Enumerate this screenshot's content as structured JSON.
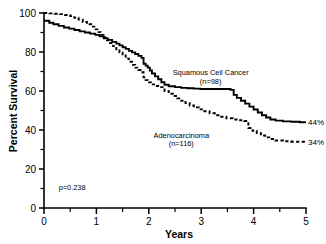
{
  "chart_data": {
    "type": "line",
    "title": "",
    "xlabel": "Years",
    "ylabel": "Percent Survival",
    "xlim": [
      0,
      5
    ],
    "ylim": [
      0,
      100
    ],
    "grid": false,
    "legend_position": "inline-annotation",
    "x_ticks": [
      "0",
      "1",
      "2",
      "3",
      "4",
      "5"
    ],
    "x_tick_values": [
      0,
      1,
      2,
      3,
      4,
      5
    ],
    "x_minor_tick_values": [
      0.5,
      1.5,
      2.5,
      3.5,
      4.5
    ],
    "y_ticks": [
      "0",
      "20",
      "40",
      "60",
      "80",
      "100"
    ],
    "y_tick_values": [
      0,
      20,
      40,
      60,
      80,
      100
    ],
    "y_minor_tick_values": [
      10,
      30,
      50,
      70,
      90
    ],
    "annotations": [
      {
        "name": "p-value",
        "text": "p=0.238",
        "x": 0.28,
        "y": 9
      },
      {
        "name": "squamous-endpoint",
        "text": "44%",
        "x": 5.02,
        "y": 44
      },
      {
        "name": "adeno-endpoint",
        "text": "34%",
        "x": 5.02,
        "y": 34
      }
    ],
    "series": [
      {
        "name": "Squamous Cell Cancer",
        "label": "Squamous Cell Cancer",
        "n_label": "(n=98)",
        "n": 98,
        "style": "solid",
        "color": "#000000",
        "final_value": 44,
        "label_x": 3.18,
        "label_y": 68,
        "points": [
          [
            0.0,
            96.0
          ],
          [
            0.1,
            95.0
          ],
          [
            0.18,
            94.2
          ],
          [
            0.28,
            93.4
          ],
          [
            0.38,
            92.6
          ],
          [
            0.48,
            92.0
          ],
          [
            0.58,
            91.3
          ],
          [
            0.68,
            90.6
          ],
          [
            0.78,
            90.0
          ],
          [
            0.88,
            89.4
          ],
          [
            0.98,
            88.8
          ],
          [
            1.06,
            88.0
          ],
          [
            1.14,
            87.0
          ],
          [
            1.22,
            86.2
          ],
          [
            1.3,
            85.2
          ],
          [
            1.38,
            84.3
          ],
          [
            1.44,
            83.4
          ],
          [
            1.5,
            82.4
          ],
          [
            1.56,
            81.6
          ],
          [
            1.62,
            80.6
          ],
          [
            1.68,
            79.8
          ],
          [
            1.74,
            79.0
          ],
          [
            1.8,
            78.0
          ],
          [
            1.86,
            77.0
          ],
          [
            1.9,
            74.0
          ],
          [
            1.94,
            73.0
          ],
          [
            1.98,
            72.0
          ],
          [
            2.02,
            70.5
          ],
          [
            2.06,
            69.0
          ],
          [
            2.12,
            67.5
          ],
          [
            2.18,
            66.0
          ],
          [
            2.24,
            64.5
          ],
          [
            2.3,
            63.2
          ],
          [
            2.38,
            62.4
          ],
          [
            2.5,
            62.0
          ],
          [
            2.62,
            61.6
          ],
          [
            2.74,
            61.4
          ],
          [
            2.86,
            61.2
          ],
          [
            2.98,
            61.0
          ],
          [
            3.1,
            61.0
          ],
          [
            3.22,
            61.0
          ],
          [
            3.34,
            61.0
          ],
          [
            3.46,
            61.0
          ],
          [
            3.56,
            60.6
          ],
          [
            3.62,
            58.0
          ],
          [
            3.68,
            56.5
          ],
          [
            3.76,
            55.0
          ],
          [
            3.84,
            53.5
          ],
          [
            3.92,
            52.0
          ],
          [
            4.0,
            50.5
          ],
          [
            4.08,
            49.0
          ],
          [
            4.16,
            47.6
          ],
          [
            4.24,
            46.4
          ],
          [
            4.32,
            45.4
          ],
          [
            4.42,
            44.8
          ],
          [
            4.56,
            44.4
          ],
          [
            4.72,
            44.2
          ],
          [
            4.88,
            44.0
          ],
          [
            5.0,
            44.0
          ]
        ]
      },
      {
        "name": "Adenocarcinoma",
        "label": "Adenocarcinoma",
        "n_label": "(n=116)",
        "n": 116,
        "style": "dashed",
        "color": "#000000",
        "final_value": 34,
        "label_x": 2.62,
        "label_y": 36,
        "points": [
          [
            0.0,
            100.0
          ],
          [
            0.1,
            99.8
          ],
          [
            0.2,
            99.6
          ],
          [
            0.3,
            99.4
          ],
          [
            0.4,
            99.0
          ],
          [
            0.5,
            98.4
          ],
          [
            0.58,
            97.6
          ],
          [
            0.66,
            96.6
          ],
          [
            0.74,
            95.4
          ],
          [
            0.82,
            94.2
          ],
          [
            0.9,
            93.0
          ],
          [
            0.96,
            91.6
          ],
          [
            1.02,
            90.2
          ],
          [
            1.08,
            88.8
          ],
          [
            1.14,
            87.4
          ],
          [
            1.2,
            86.0
          ],
          [
            1.26,
            84.6
          ],
          [
            1.32,
            83.0
          ],
          [
            1.38,
            81.4
          ],
          [
            1.44,
            79.8
          ],
          [
            1.5,
            78.2
          ],
          [
            1.56,
            76.6
          ],
          [
            1.62,
            75.0
          ],
          [
            1.68,
            73.4
          ],
          [
            1.74,
            72.0
          ],
          [
            1.8,
            70.8
          ],
          [
            1.86,
            69.6
          ],
          [
            1.9,
            67.0
          ],
          [
            1.94,
            65.6
          ],
          [
            1.98,
            64.4
          ],
          [
            2.04,
            63.4
          ],
          [
            2.12,
            62.6
          ],
          [
            2.2,
            62.0
          ],
          [
            2.3,
            60.0
          ],
          [
            2.38,
            58.6
          ],
          [
            2.46,
            57.4
          ],
          [
            2.54,
            56.2
          ],
          [
            2.62,
            55.0
          ],
          [
            2.7,
            53.8
          ],
          [
            2.78,
            52.6
          ],
          [
            2.86,
            51.6
          ],
          [
            2.96,
            50.6
          ],
          [
            3.06,
            49.6
          ],
          [
            3.16,
            48.6
          ],
          [
            3.26,
            47.6
          ],
          [
            3.36,
            46.8
          ],
          [
            3.48,
            46.0
          ],
          [
            3.6,
            45.4
          ],
          [
            3.72,
            45.0
          ],
          [
            3.82,
            44.6
          ],
          [
            3.9,
            41.0
          ],
          [
            3.98,
            39.6
          ],
          [
            4.06,
            38.4
          ],
          [
            4.14,
            37.2
          ],
          [
            4.22,
            36.2
          ],
          [
            4.3,
            35.4
          ],
          [
            4.42,
            34.6
          ],
          [
            4.56,
            34.2
          ],
          [
            4.72,
            34.0
          ],
          [
            4.88,
            34.0
          ],
          [
            5.0,
            34.0
          ]
        ]
      }
    ]
  },
  "figure": {
    "plot_left": 44,
    "plot_right": 306,
    "plot_top": 13,
    "plot_bottom": 208
  }
}
